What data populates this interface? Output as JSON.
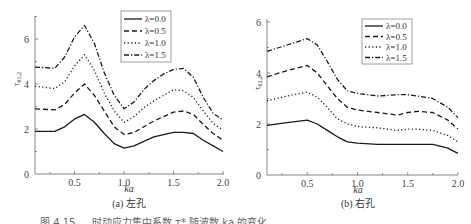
{
  "chart_data": [
    {
      "type": "line",
      "title": "",
      "subtitle": "(a) 左孔",
      "xlabel": "ka",
      "ylabel": "τ*θ1,2",
      "xlim": [
        0.1,
        2.0
      ],
      "ylim": [
        0,
        7
      ],
      "xticks": [
        "0.5",
        "1.0",
        "1.5",
        "2.0"
      ],
      "yticks": [
        "0",
        "2",
        "4",
        "6"
      ],
      "grid": false,
      "legend_position": "upper right",
      "x": [
        0.1,
        0.3,
        0.4,
        0.5,
        0.6,
        0.7,
        0.8,
        0.9,
        1.0,
        1.1,
        1.2,
        1.3,
        1.4,
        1.5,
        1.6,
        1.7,
        1.8,
        1.9,
        2.0
      ],
      "series": [
        {
          "name": "λ=0.0",
          "style": "solid",
          "values": [
            1.9,
            1.9,
            2.1,
            2.45,
            2.65,
            2.3,
            1.8,
            1.35,
            1.15,
            1.25,
            1.45,
            1.65,
            1.75,
            1.85,
            1.85,
            1.8,
            1.5,
            1.25,
            1.0
          ]
        },
        {
          "name": "λ=0.5",
          "style": "dashed",
          "values": [
            2.9,
            2.85,
            3.1,
            3.6,
            4.0,
            3.5,
            2.8,
            2.1,
            1.75,
            1.85,
            2.1,
            2.35,
            2.55,
            2.75,
            2.8,
            2.65,
            2.2,
            1.8,
            1.5
          ]
        },
        {
          "name": "λ=1.0",
          "style": "dotted",
          "values": [
            3.9,
            3.8,
            4.1,
            4.8,
            5.3,
            4.6,
            3.6,
            2.8,
            2.3,
            2.55,
            2.95,
            3.25,
            3.5,
            3.75,
            3.7,
            3.4,
            2.8,
            2.25,
            1.95
          ]
        },
        {
          "name": "λ=1.5",
          "style": "dashdot",
          "values": [
            4.75,
            4.7,
            5.2,
            6.1,
            6.6,
            5.8,
            4.5,
            3.5,
            2.9,
            3.2,
            3.75,
            4.15,
            4.45,
            4.65,
            4.7,
            4.3,
            3.4,
            2.7,
            2.4
          ]
        }
      ]
    },
    {
      "type": "line",
      "title": "",
      "subtitle": "(b) 右孔",
      "xlabel": "ka",
      "ylabel": "τ*θ2,2",
      "xlim": [
        0.1,
        2.0
      ],
      "ylim": [
        0,
        6
      ],
      "xticks": [
        "0.5",
        "1.0",
        "1.5",
        "2.0"
      ],
      "yticks": [
        "0",
        "2",
        "4",
        "6"
      ],
      "grid": false,
      "legend_position": "upper right",
      "x": [
        0.1,
        0.3,
        0.5,
        0.6,
        0.7,
        0.8,
        0.9,
        1.0,
        1.2,
        1.4,
        1.5,
        1.6,
        1.75,
        1.9,
        2.0
      ],
      "series": [
        {
          "name": "λ=0.0",
          "style": "solid",
          "values": [
            1.95,
            2.05,
            2.15,
            2.0,
            1.75,
            1.5,
            1.3,
            1.25,
            1.2,
            1.2,
            1.2,
            1.2,
            1.2,
            1.05,
            0.85
          ]
        },
        {
          "name": "λ=0.5",
          "style": "dashed",
          "values": [
            3.85,
            4.1,
            4.3,
            4.0,
            3.5,
            3.0,
            2.65,
            2.55,
            2.45,
            2.35,
            2.45,
            2.5,
            2.45,
            2.15,
            1.8
          ]
        },
        {
          "name": "λ=1.0",
          "style": "dotted",
          "values": [
            2.9,
            3.1,
            3.25,
            3.05,
            2.65,
            2.2,
            2.0,
            1.9,
            1.85,
            1.75,
            1.8,
            1.8,
            1.75,
            1.55,
            1.3
          ]
        },
        {
          "name": "λ=1.5",
          "style": "dashdot",
          "values": [
            4.85,
            5.1,
            5.35,
            5.1,
            4.45,
            3.75,
            3.3,
            3.2,
            3.1,
            3.15,
            3.15,
            3.1,
            3.0,
            2.65,
            2.25
          ]
        }
      ]
    }
  ],
  "figure": {
    "panel_a_label": "(a) 左孔",
    "panel_b_label": "(b) 右孔",
    "xlabel": "ka",
    "ylabel_a_main": "τ",
    "ylabel_a_sub": "θ1,2",
    "ylabel_b_main": "τ",
    "ylabel_b_sub": "θ2,2",
    "legend": [
      "λ=0.0",
      "λ=0.5",
      "λ=1.0",
      "λ=1.5"
    ],
    "caption_partial": "图 4.15 … 时动应力集中系数 τ* 随波数 ka 的变化"
  }
}
